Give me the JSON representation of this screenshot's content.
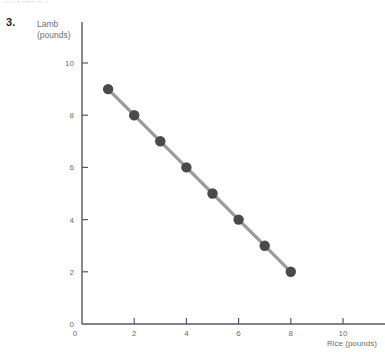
{
  "figure": {
    "item_number": "3.",
    "top_cut_text": "CHAPTER 1"
  },
  "chart_data": {
    "type": "line",
    "title": "",
    "subtitle": "",
    "xlabel": "Rice (pounds)",
    "ylabel": "Lamb (pounds)",
    "ylabel_line1": "Lamb",
    "ylabel_line2": "(pounds)",
    "x": [
      1,
      2,
      3,
      4,
      5,
      6,
      7,
      8
    ],
    "values": [
      9,
      8,
      7,
      6,
      5,
      4,
      3,
      2
    ],
    "series": [
      {
        "name": "Production possibilities",
        "x": [
          1,
          2,
          3,
          4,
          5,
          6,
          7,
          8
        ],
        "values": [
          9,
          8,
          7,
          6,
          5,
          4,
          3,
          2
        ]
      }
    ],
    "points": [
      {
        "x": 1,
        "y": 9
      },
      {
        "x": 2,
        "y": 8
      },
      {
        "x": 3,
        "y": 7
      },
      {
        "x": 4,
        "y": 6
      },
      {
        "x": 5,
        "y": 5
      },
      {
        "x": 6,
        "y": 4
      },
      {
        "x": 7,
        "y": 3
      },
      {
        "x": 8,
        "y": 2
      }
    ],
    "xlim": [
      0,
      11.6
    ],
    "ylim": [
      0,
      11.6
    ],
    "xticks": [
      0,
      2,
      4,
      6,
      8,
      10
    ],
    "yticks": [
      0,
      2,
      4,
      6,
      8,
      10
    ],
    "xtick_labels": [
      "0",
      "2",
      "4",
      "6",
      "8",
      "10"
    ],
    "ytick_labels": [
      "0",
      "2",
      "4",
      "6",
      "8",
      "10"
    ],
    "grid": false,
    "legend": false,
    "legend_position": "none",
    "marker": "circle",
    "markers": true,
    "colors": {
      "line": "#9b9b9b",
      "marker": "#4a4a4a",
      "axis": "#58595b",
      "tick_label": "#6d6e71",
      "background": "#ffffff"
    }
  }
}
